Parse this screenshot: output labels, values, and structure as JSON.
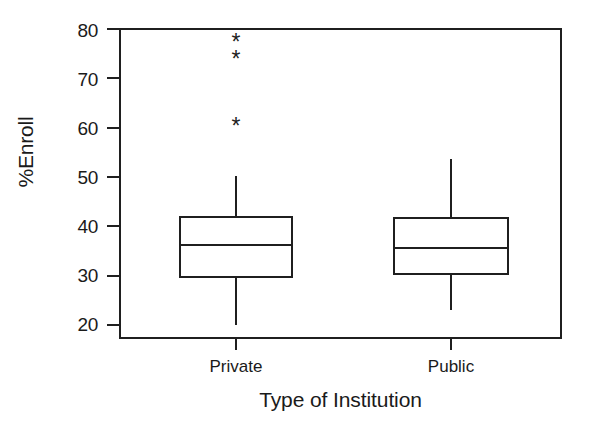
{
  "chart_data": {
    "type": "box",
    "title": "",
    "xlabel": "Type of Institution",
    "ylabel": "%Enroll",
    "categories": [
      "Private",
      "Public"
    ],
    "ylim": [
      20,
      80
    ],
    "yticks": [
      20,
      30,
      40,
      50,
      60,
      70,
      80
    ],
    "ytick_labels": [
      "20",
      "30",
      "40",
      "50",
      "60",
      "70",
      "80"
    ],
    "grid": false,
    "legend": "none",
    "frame": "box",
    "outlier_marker": "*",
    "series": [
      {
        "name": "Private",
        "whisker_low": 20.0,
        "q1": 29.7,
        "median": 36.2,
        "q3": 41.9,
        "whisker_high": 50.2,
        "outliers": [
          60.3,
          73.9,
          77.3
        ]
      },
      {
        "name": "Public",
        "whisker_low": 23.0,
        "q1": 30.3,
        "median": 35.6,
        "q3": 41.7,
        "whisker_high": 53.6,
        "outliers": []
      }
    ]
  },
  "axis": {
    "y_title": "%Enroll",
    "x_title": "Type of Institution",
    "y_tick_0": "20",
    "y_tick_1": "30",
    "y_tick_2": "40",
    "y_tick_3": "50",
    "y_tick_4": "60",
    "y_tick_5": "70",
    "y_tick_6": "80",
    "x_tick_0": "Private",
    "x_tick_1": "Public"
  },
  "colors": {
    "line": "#1f1f1f",
    "background": "#ffffff",
    "text": "#1a1a1a"
  }
}
